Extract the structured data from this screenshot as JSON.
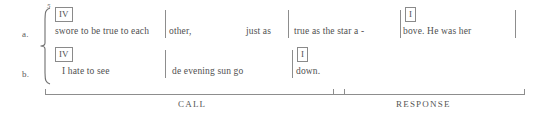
{
  "figure": {
    "example_number": "5",
    "rows": [
      {
        "label": "a.",
        "chords": [
          {
            "symbol": "IV",
            "x": 55,
            "y": 7
          },
          {
            "symbol": "I",
            "x": 405,
            "y": 10
          }
        ],
        "segments": [
          {
            "text": "swore to  be true to  each",
            "x": 55
          },
          {
            "text": "other,",
            "x": 169
          },
          {
            "text": "just as",
            "x": 246
          },
          {
            "text": "true   as   the   star  a  -",
            "x": 294
          },
          {
            "text": "bove.   He   was   her",
            "x": 403
          }
        ],
        "barlines": [
          165,
          288,
          400,
          515
        ]
      },
      {
        "label": "b.",
        "chords": [
          {
            "symbol": "IV",
            "x": 55,
            "y": 47
          },
          {
            "symbol": "I",
            "x": 297,
            "y": 50
          }
        ],
        "segments": [
          {
            "text": "I   hate to  see",
            "x": 62
          },
          {
            "text": "de    evening  sun   go",
            "x": 172
          },
          {
            "text": "down.",
            "x": 296
          }
        ],
        "barlines": [
          165,
          292
        ]
      }
    ],
    "sections": [
      {
        "caption": "CALL",
        "left": 45,
        "width": 300,
        "caption_center": 195
      },
      {
        "caption": "RESPONSE",
        "left": 333,
        "width": 192,
        "caption_center": 429
      }
    ],
    "colors": {
      "ink": "#4f4f4f",
      "rule": "#8d8d8d",
      "box_border": "#8a8a8a",
      "background": "#ffffff"
    }
  }
}
